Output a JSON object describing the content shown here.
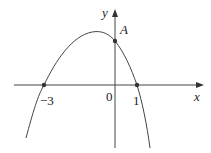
{
  "diagram": {
    "type": "function-graph",
    "axes": {
      "x_label": "x",
      "y_label": "y",
      "origin_label": "0"
    },
    "tick_labels": [
      {
        "text": "-3",
        "display": "−3",
        "value": -3
      },
      {
        "text": "1",
        "display": "1",
        "value": 1
      }
    ],
    "points": [
      {
        "name": "A",
        "label": "A",
        "role": "y-intercept"
      },
      {
        "name": "root-left",
        "x": -3,
        "y": 0
      },
      {
        "name": "root-right",
        "x": 1,
        "y": 0
      }
    ],
    "colors": {
      "curve": "#444444",
      "axes": "#444444",
      "points": "#333333",
      "text": "#222222"
    }
  },
  "labels": {
    "x_axis": "x",
    "y_axis": "y",
    "origin": "0",
    "tick_neg3": "−3",
    "tick_1": "1",
    "point_A": "A"
  }
}
